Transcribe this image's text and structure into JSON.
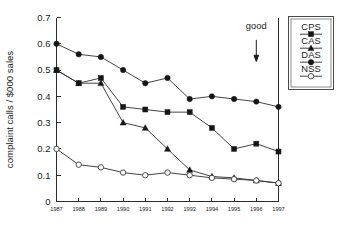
{
  "chart_data": {
    "type": "line",
    "title": "",
    "xlabel": "",
    "ylabel": "complaint calls / $000 sales",
    "categories": [
      "1987",
      "1988",
      "1989",
      "1990",
      "1991",
      "1992",
      "1993",
      "1994",
      "1995",
      "1996",
      "1997"
    ],
    "x": [
      1987,
      1988,
      1989,
      1990,
      1991,
      1992,
      1993,
      1994,
      1995,
      1996,
      1997
    ],
    "ylim": [
      0,
      0.7
    ],
    "xlim": [
      1987,
      1997
    ],
    "ytick_labels": [
      "0",
      "0.1",
      "0.2",
      "0.3",
      "0.4",
      "0.5",
      "0.6",
      "0.7"
    ],
    "ytick_values": [
      0,
      0.1,
      0.2,
      0.3,
      0.4,
      0.5,
      0.6,
      0.7
    ],
    "grid": false,
    "legend_position": "right-outside",
    "series": [
      {
        "name": "CPS",
        "marker": "filled-square",
        "color": "#161616",
        "values": [
          0.5,
          0.45,
          0.47,
          0.36,
          0.35,
          0.34,
          0.34,
          0.28,
          0.2,
          0.22,
          0.19
        ]
      },
      {
        "name": "CAS",
        "marker": "filled-triangle",
        "color": "#161616",
        "values": [
          0.5,
          0.45,
          0.45,
          0.3,
          0.28,
          0.2,
          0.12,
          0.095,
          0.09,
          0.08,
          0.07
        ]
      },
      {
        "name": "DAS",
        "marker": "filled-circle",
        "color": "#161616",
        "values": [
          0.6,
          0.56,
          0.55,
          0.5,
          0.45,
          0.47,
          0.39,
          0.4,
          0.39,
          0.38,
          0.36
        ]
      },
      {
        "name": "NSS",
        "marker": "open-circle",
        "color": "#3a3a3a",
        "values": [
          0.2,
          0.14,
          0.13,
          0.11,
          0.1,
          0.11,
          0.1,
          0.09,
          0.085,
          0.08,
          0.07
        ]
      }
    ],
    "annotations": [
      {
        "text": "good",
        "x": 1996,
        "y_text": 0.655,
        "arrow": "down",
        "arrow_from_y": 0.615,
        "arrow_to_y": 0.545
      }
    ]
  },
  "legend": {
    "entries": [
      {
        "label": "CPS",
        "marker": "filled-square"
      },
      {
        "label": "CAS",
        "marker": "filled-triangle"
      },
      {
        "label": "DAS",
        "marker": "filled-circle"
      },
      {
        "label": "NSS",
        "marker": "open-circle"
      }
    ]
  }
}
